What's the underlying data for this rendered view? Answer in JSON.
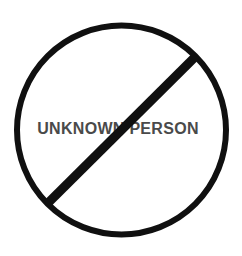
{
  "sign": {
    "kind": "prohibition-sign",
    "label": "UNKNOWN PERSON"
  },
  "colors": {
    "background": "#ffffff",
    "circle_outline": "#101010",
    "slash": "#101010",
    "label_text": "#4a4a4a"
  }
}
